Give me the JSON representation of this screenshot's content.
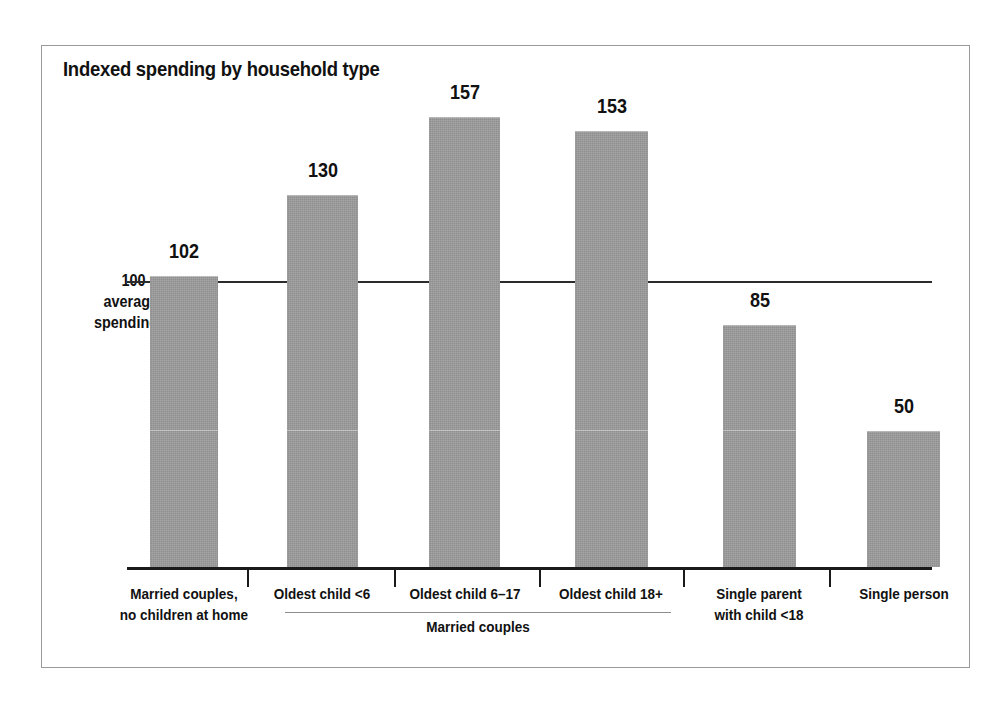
{
  "chart_data": {
    "type": "bar",
    "title": "Indexed spending by household type",
    "xlabel": "",
    "ylabel": "",
    "categories": [
      "Married couples, no children at home",
      "Oldest child <6",
      "Oldest child 6–17",
      "Oldest child 18+",
      "Single parent with child <18",
      "Single person"
    ],
    "values": [
      102,
      130,
      157,
      153,
      85,
      50
    ],
    "ylim": [
      0,
      175
    ],
    "grid": false,
    "legend": "none",
    "reference_line": {
      "value": 100,
      "label": "100 = average spending"
    },
    "group_brackets": [
      {
        "label": "Married couples",
        "categories": [
          "Oldest child <6",
          "Oldest child 6–17",
          "Oldest child 18+"
        ]
      }
    ]
  },
  "figure": {
    "title": "Indexed spending by household type",
    "axis_annotation": {
      "line1": "100 =",
      "line2": "average",
      "line3": "spending"
    },
    "group_bracket_label": "Married couples",
    "bars": [
      {
        "value_label": "102",
        "label_lines": [
          "Married couples,",
          "no children at home"
        ]
      },
      {
        "value_label": "130",
        "label_lines": [
          "Oldest child <6"
        ]
      },
      {
        "value_label": "157",
        "label_lines": [
          "Oldest child 6–17"
        ]
      },
      {
        "value_label": "153",
        "label_lines": [
          "Oldest child 18+"
        ]
      },
      {
        "value_label": "85",
        "label_lines": [
          "Single parent",
          "with child <18"
        ]
      },
      {
        "value_label": "50",
        "label_lines": [
          "Single person"
        ]
      }
    ],
    "colors": {
      "bar_fill": "#9a9a9a",
      "axis": "#1a1a1a",
      "reference_line": "#2b2b2b",
      "text": "#111111",
      "frame": "#9a9a9a",
      "background": "#ffffff"
    }
  }
}
